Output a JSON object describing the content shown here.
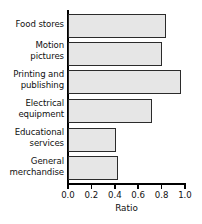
{
  "chart_data": {
    "type": "bar",
    "orientation": "horizontal",
    "title": "",
    "subtitle": "",
    "xlabel": "Ratio",
    "ylabel": "",
    "categories": [
      "Food stores",
      "Motion pictures",
      "Printing and publishing",
      "Electrical equipment",
      "Educational services",
      "General merchandise"
    ],
    "values": [
      0.84,
      0.8,
      0.97,
      0.72,
      0.41,
      0.43
    ],
    "xlim": [
      0.0,
      1.0
    ],
    "xticks": [
      0.0,
      0.2,
      0.4,
      0.6,
      0.8,
      1.0
    ],
    "xtick_labels": [
      "0.0",
      "0.2",
      "0.4",
      "0.6",
      "0.8",
      "1.0"
    ],
    "grid": false,
    "legend": null,
    "legend_position": "none",
    "bar_fill_color": "#e6e6e6",
    "bar_edge_color": "#2b2b2b",
    "axis_color": "#000000"
  },
  "labels": {
    "cat0_line1": "Food stores",
    "cat1_line1": "Motion",
    "cat1_line2": "pictures",
    "cat2_line1": "Printing and",
    "cat2_line2": "publishing",
    "cat3_line1": "Electrical",
    "cat3_line2": "equipment",
    "cat4_line1": "Educational",
    "cat4_line2": "services",
    "cat5_line1": "General",
    "cat5_line2": "merchandise"
  }
}
